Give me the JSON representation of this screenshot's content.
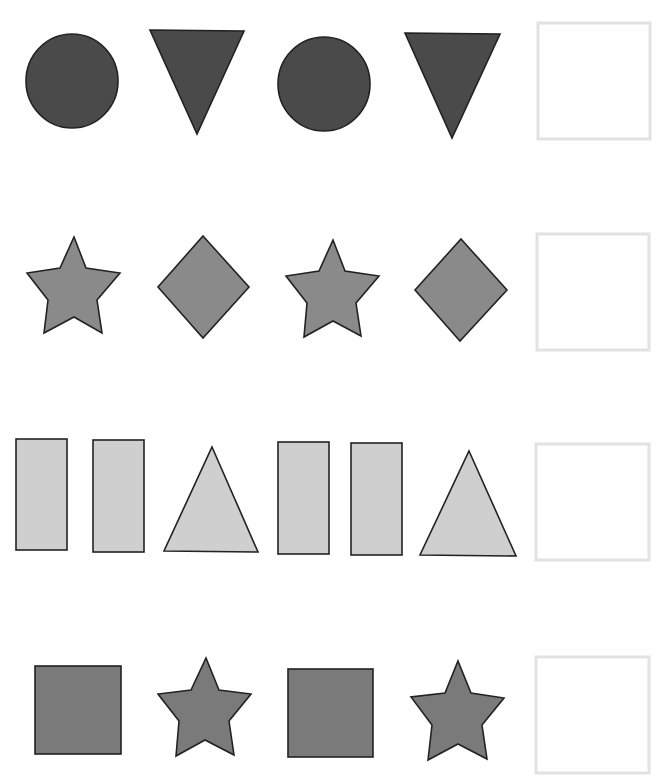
{
  "worksheet": {
    "type": "pattern-completion",
    "colors": {
      "dark": "#4a4a4a",
      "medium": "#8a8a8a",
      "light": "#cfcfcf",
      "medium_dark": "#7a7a7a",
      "outline": "#222222",
      "answer_box_border": "#e2e2e2"
    },
    "rows": [
      {
        "name": "row-1",
        "pattern": [
          "circle",
          "triangle-down",
          "circle",
          "triangle-down"
        ],
        "fill": "dark",
        "answer_box": "empty"
      },
      {
        "name": "row-2",
        "pattern": [
          "star",
          "diamond",
          "star",
          "diamond"
        ],
        "fill": "medium",
        "answer_box": "empty"
      },
      {
        "name": "row-3",
        "pattern": [
          "rectangle",
          "rectangle",
          "triangle-up",
          "rectangle",
          "rectangle",
          "triangle-up"
        ],
        "fill": "light",
        "answer_box": "empty"
      },
      {
        "name": "row-4",
        "pattern": [
          "square",
          "star",
          "square",
          "star"
        ],
        "fill": "medium_dark",
        "answer_box": "empty"
      }
    ]
  }
}
